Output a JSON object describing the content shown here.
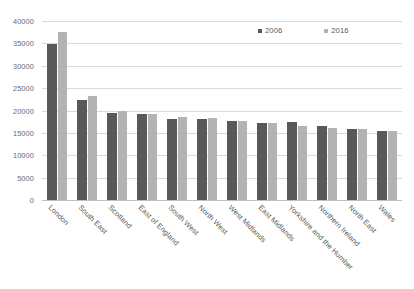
{
  "chart_data": {
    "type": "bar",
    "title": "",
    "subtitle": "",
    "xlabel": "",
    "ylabel": "",
    "ylim": [
      0,
      40000
    ],
    "ytick_step": 5000,
    "yticks": [
      "0",
      "5000",
      "10000",
      "15000",
      "20000",
      "25000",
      "30000",
      "35000",
      "40000"
    ],
    "grid": true,
    "legend_position": "top-right",
    "categories": [
      "London",
      "South East",
      "Scotland",
      "East of England",
      "South West",
      "North West",
      "West Midlands",
      "East Midlands",
      "Yorkshire and the Humber",
      "Northern Ireland",
      "North East",
      "Wales"
    ],
    "series": [
      {
        "name": "2006",
        "color": "#595959",
        "values": [
          34900,
          22300,
          19400,
          19200,
          18000,
          18100,
          17600,
          17200,
          17400,
          16500,
          15900,
          15500
        ]
      },
      {
        "name": "2016",
        "color": "#b3b3b3",
        "values": [
          37600,
          23200,
          19900,
          19200,
          18500,
          18300,
          17700,
          17200,
          16600,
          16200,
          15800,
          15400
        ]
      }
    ]
  },
  "legend": {
    "entries": [
      {
        "label": "2006",
        "swatch": "legend-swatch-2006"
      },
      {
        "label": "2016",
        "swatch": "legend-swatch-2016"
      }
    ]
  },
  "colors": {
    "series_2006": "#595959",
    "series_2016": "#b3b3b3",
    "gridline": "#d9d9d9",
    "axis": "#bfbfbf",
    "tick_text": "#5a5a5a",
    "background": "#ffffff"
  }
}
